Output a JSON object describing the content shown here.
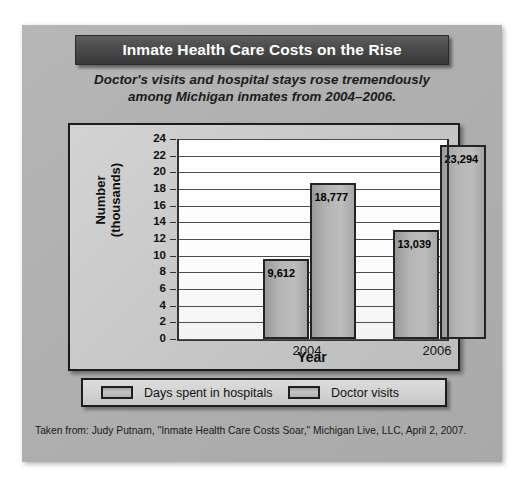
{
  "figure": {
    "title": "Inmate Health Care Costs on the Rise",
    "subtitle_line1": "Doctor's visits and hospital stays rose tremendously",
    "subtitle_line2": "among Michigan inmates from 2004–2006.",
    "source": "Taken from: Judy Putnam, \"Inmate Health Care Costs Soar,\" Michigan Live, LLC, April 2, 2007."
  },
  "colors": {
    "banner_dark": "#4a4a4a",
    "banner_text": "#ffffff",
    "card_gray": "#b2b2b2",
    "bar_fill": "#b4b4b4",
    "bar_stroke": "#232323",
    "plot_bg": "#ffffff",
    "gridline": "#4d4d4d"
  },
  "chart_data": {
    "type": "bar",
    "title": "Inmate Health Care Costs on the Rise",
    "subtitle": "Doctor's visits and hospital stays rose tremendously among Michigan inmates from 2004–2006.",
    "xlabel": "Year",
    "ylabel": "Number (thousands)",
    "ylabel_line1": "Number",
    "ylabel_line2": "(thousands)",
    "categories": [
      "2004",
      "2006"
    ],
    "ylim": [
      0,
      24
    ],
    "ytick_step": 2,
    "yticks": [
      24,
      22,
      20,
      18,
      16,
      14,
      12,
      10,
      8,
      6,
      4,
      2,
      0
    ],
    "grid": true,
    "grid_axis": "y",
    "legend_position": "bottom",
    "value_unit": "thousands",
    "series": [
      {
        "name": "Days spent in hospitals",
        "values": [
          9.612,
          18.777
        ],
        "labels": [
          "9,612",
          "18,777"
        ]
      },
      {
        "name": "Doctor visits",
        "values": [
          13.039,
          23.294
        ],
        "labels": [
          "13,039",
          "23,294"
        ]
      }
    ],
    "bars": [
      {
        "category": "2004",
        "series": "Days spent in hospitals",
        "value": 9.612,
        "label": "9,612"
      },
      {
        "category": "2004",
        "series": "Doctor visits",
        "value": 18.777,
        "label": "18,777"
      },
      {
        "category": "2006",
        "series": "Days spent in hospitals",
        "value": 13.039,
        "label": "13,039"
      },
      {
        "category": "2006",
        "series": "Doctor visits",
        "value": 23.294,
        "label": "23,294"
      }
    ]
  },
  "legend": {
    "entries": [
      {
        "label": "Days spent in hospitals"
      },
      {
        "label": "Doctor visits"
      }
    ]
  }
}
